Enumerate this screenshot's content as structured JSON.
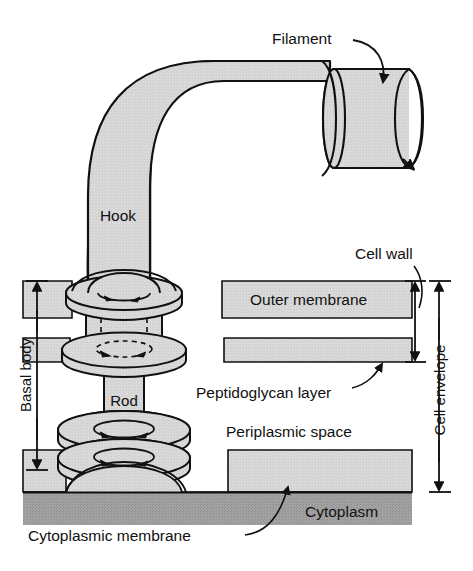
{
  "figure": {
    "type": "labeled-diagram"
  },
  "labels": {
    "filament": "Filament",
    "hook": "Hook",
    "rod": "Rod",
    "cell_wall": "Cell wall",
    "outer_membrane": "Outer membrane",
    "peptidoglycan_layer": "Peptidoglycan layer",
    "periplasmic_space": "Periplasmic space",
    "cytoplasm": "Cytoplasm",
    "cytoplasmic_membrane": "Cytoplasmic membrane",
    "basal_body": "Basal body",
    "cell_envelope": "Cell envelope"
  },
  "colors": {
    "ink": "#111111",
    "structure_fill": "#d6d6d6",
    "ring_fill": "#dcdcdc",
    "membrane_fill": "#d2d2d2",
    "cytoplasm_fill": "#9b9b9b",
    "background": "#ffffff"
  },
  "brackets": {
    "basal_body": {
      "side": "left",
      "label": "Basal body",
      "top_y": 281,
      "bottom_y": 470
    },
    "cell_wall": {
      "side": "right",
      "label": "Cell wall",
      "top_y": 281,
      "bottom_y": 362
    },
    "cell_envelope": {
      "side": "right",
      "label": "Cell envelope",
      "top_y": 281,
      "bottom_y": 492
    }
  },
  "layers": [
    {
      "name": "outer-membrane",
      "label": "Outer membrane",
      "top": 281,
      "bottom": 318,
      "fill": "#d2d2d2"
    },
    {
      "name": "peptidoglycan-layer",
      "label": "Peptidoglycan layer",
      "top": 338,
      "bottom": 362,
      "fill": "#d2d2d2"
    },
    {
      "name": "periplasmic-space",
      "label": "Periplasmic space",
      "top": 362,
      "bottom": 450,
      "fill": "#ffffff"
    },
    {
      "name": "cytoplasmic-membrane",
      "label": "Cytoplasmic membrane",
      "top": 450,
      "bottom": 492,
      "fill": "#d2d2d2"
    },
    {
      "name": "cytoplasm",
      "label": "Cytoplasm",
      "top": 492,
      "bottom": 525,
      "fill": "#9b9b9b"
    }
  ],
  "rings": [
    {
      "name": "L-ring",
      "center_y": 295
    },
    {
      "name": "P-ring",
      "center_y": 350
    },
    {
      "name": "S-ring",
      "center_y": 430
    },
    {
      "name": "M-ring",
      "center_y": 458
    }
  ]
}
